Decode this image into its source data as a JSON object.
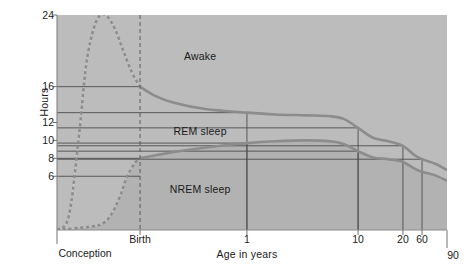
{
  "chart_data": {
    "type": "area",
    "title": "",
    "subtitle": "",
    "xlabel": "Age in years",
    "ylabel": "Hours",
    "grid": false,
    "legend_position": "inline-annotations",
    "ylim": [
      0,
      24
    ],
    "y_ticks": [
      {
        "label": "24",
        "value": 24
      },
      {
        "label": "16",
        "value": 16
      },
      {
        "label": "12",
        "value": 12
      },
      {
        "label": "10",
        "value": 10
      },
      {
        "label": "8",
        "value": 8
      },
      {
        "label": "6",
        "value": 6
      }
    ],
    "x_ticks": [
      {
        "label": "Conception",
        "pos": 0.0
      },
      {
        "label": "Birth",
        "pos": 0.213
      },
      {
        "label": "1",
        "pos": 0.487
      },
      {
        "label": "10",
        "pos": 0.772
      },
      {
        "label": "20",
        "pos": 0.887
      },
      {
        "label": "60",
        "pos": 0.936
      },
      {
        "label": "90",
        "pos": 1.0
      }
    ],
    "annotations": [
      {
        "text": "Awake",
        "x_pos": 0.367,
        "y_hours": 19.4
      },
      {
        "text": "REM sleep",
        "x_pos": 0.367,
        "y_hours": 11.0
      },
      {
        "text": "NREM sleep",
        "x_pos": 0.367,
        "y_hours": 4.6
      }
    ],
    "series": [
      {
        "name": "Total sleep (Awake boundary)",
        "description": "Upper curve: total hours of sleep per day",
        "points": [
          {
            "x_pos": 0.0,
            "hours": 0.0
          },
          {
            "x_pos": 0.03,
            "hours": 1.5
          },
          {
            "x_pos": 0.055,
            "hours": 10.0
          },
          {
            "x_pos": 0.075,
            "hours": 18.5
          },
          {
            "x_pos": 0.095,
            "hours": 22.6
          },
          {
            "x_pos": 0.112,
            "hours": 24.0
          },
          {
            "x_pos": 0.13,
            "hours": 23.8
          },
          {
            "x_pos": 0.15,
            "hours": 22.3
          },
          {
            "x_pos": 0.17,
            "hours": 20.0
          },
          {
            "x_pos": 0.192,
            "hours": 17.6
          },
          {
            "x_pos": 0.213,
            "hours": 16.0
          },
          {
            "x_pos": 0.25,
            "hours": 15.0
          },
          {
            "x_pos": 0.3,
            "hours": 14.2
          },
          {
            "x_pos": 0.38,
            "hours": 13.5
          },
          {
            "x_pos": 0.487,
            "hours": 13.1
          },
          {
            "x_pos": 0.56,
            "hours": 12.9
          },
          {
            "x_pos": 0.64,
            "hours": 12.8
          },
          {
            "x_pos": 0.7,
            "hours": 12.7
          },
          {
            "x_pos": 0.735,
            "hours": 12.4
          },
          {
            "x_pos": 0.772,
            "hours": 11.4
          },
          {
            "x_pos": 0.81,
            "hours": 10.3
          },
          {
            "x_pos": 0.85,
            "hours": 9.9
          },
          {
            "x_pos": 0.887,
            "hours": 9.4
          },
          {
            "x_pos": 0.915,
            "hours": 8.4
          },
          {
            "x_pos": 0.936,
            "hours": 7.9
          },
          {
            "x_pos": 0.97,
            "hours": 7.4
          },
          {
            "x_pos": 1.0,
            "hours": 6.7
          }
        ]
      },
      {
        "name": "NREM sleep (REM/NREM boundary)",
        "description": "Lower curve: hours of non-REM sleep per day",
        "points": [
          {
            "x_pos": 0.0,
            "hours": 0.0
          },
          {
            "x_pos": 0.09,
            "hours": 0.4
          },
          {
            "x_pos": 0.12,
            "hours": 0.8
          },
          {
            "x_pos": 0.14,
            "hours": 1.8
          },
          {
            "x_pos": 0.16,
            "hours": 3.6
          },
          {
            "x_pos": 0.18,
            "hours": 6.0
          },
          {
            "x_pos": 0.2,
            "hours": 7.5
          },
          {
            "x_pos": 0.213,
            "hours": 8.0
          },
          {
            "x_pos": 0.26,
            "hours": 8.4
          },
          {
            "x_pos": 0.33,
            "hours": 8.9
          },
          {
            "x_pos": 0.42,
            "hours": 9.4
          },
          {
            "x_pos": 0.487,
            "hours": 9.7
          },
          {
            "x_pos": 0.56,
            "hours": 9.9
          },
          {
            "x_pos": 0.64,
            "hours": 10.0
          },
          {
            "x_pos": 0.7,
            "hours": 9.9
          },
          {
            "x_pos": 0.735,
            "hours": 9.6
          },
          {
            "x_pos": 0.772,
            "hours": 8.8
          },
          {
            "x_pos": 0.81,
            "hours": 8.1
          },
          {
            "x_pos": 0.85,
            "hours": 7.9
          },
          {
            "x_pos": 0.887,
            "hours": 7.6
          },
          {
            "x_pos": 0.915,
            "hours": 6.9
          },
          {
            "x_pos": 0.936,
            "hours": 6.5
          },
          {
            "x_pos": 0.97,
            "hours": 6.1
          },
          {
            "x_pos": 1.0,
            "hours": 5.5
          }
        ]
      }
    ],
    "reference_lines": [
      {
        "hours": 16,
        "to_x_pos": 0.213,
        "note": "16 h at Birth"
      },
      {
        "hours": 13.1,
        "to_x_pos": 0.487,
        "note": "total sleep at age 1"
      },
      {
        "hours": 9.7,
        "to_x_pos": 0.487,
        "note": "NREM at age 1"
      },
      {
        "hours": 11.4,
        "to_x_pos": 0.772,
        "note": "total sleep at age 10"
      },
      {
        "hours": 8.8,
        "to_x_pos": 0.772,
        "note": "NREM at age 10"
      },
      {
        "hours": 8.0,
        "to_x_pos": 0.213,
        "note": "8 h NREM at Birth"
      },
      {
        "hours": 6.0,
        "to_x_pos": 0.213,
        "note": "6 h reference"
      },
      {
        "hours": 9.4,
        "to_x_pos": 0.887,
        "note": "total sleep at age 20"
      },
      {
        "hours": 7.9,
        "to_x_pos": 0.936,
        "note": "total sleep at age 60"
      }
    ],
    "colors": {
      "fill": "#bcbcbc",
      "fill_light": "#c7c7c7",
      "curve": "#8c8c8c",
      "reference_line": "#4d4d4d",
      "dashed_birth_line": "#5a5a5a",
      "axis": "#8a8a8a",
      "text": "#1a1a1a",
      "background": "#ffffff"
    }
  }
}
